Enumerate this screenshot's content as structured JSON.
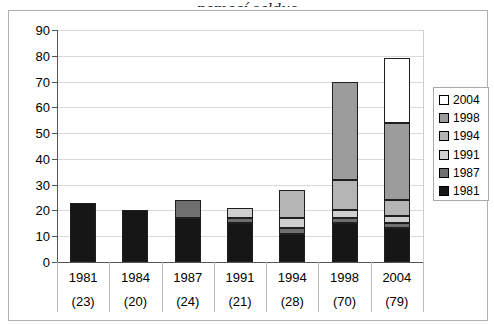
{
  "chart_data": {
    "type": "bar",
    "stacked": true,
    "partial_title_text": "pomocí saldus",
    "categories": [
      "1981",
      "1984",
      "1987",
      "1991",
      "1994",
      "1998",
      "2004"
    ],
    "category_counts": [
      "(23)",
      "(20)",
      "(24)",
      "(21)",
      "(28)",
      "(70)",
      "(79)"
    ],
    "totals": [
      23,
      20,
      24,
      21,
      28,
      70,
      79
    ],
    "series": [
      {
        "name": "1981",
        "color": "#161616",
        "values": [
          23,
          20,
          17,
          15,
          11,
          15,
          13
        ]
      },
      {
        "name": "1987",
        "color": "#6f6f6f",
        "values": [
          0,
          0,
          7,
          2,
          2,
          2,
          2
        ]
      },
      {
        "name": "1991",
        "color": "#cfcfcf",
        "values": [
          0,
          0,
          0,
          4,
          4,
          3,
          3
        ]
      },
      {
        "name": "1994",
        "color": "#b5b5b5",
        "values": [
          0,
          0,
          0,
          0,
          11,
          12,
          6
        ]
      },
      {
        "name": "1998",
        "color": "#9c9c9c",
        "values": [
          0,
          0,
          0,
          0,
          0,
          38,
          30
        ]
      },
      {
        "name": "2004",
        "color": "#ffffff",
        "values": [
          0,
          0,
          0,
          0,
          0,
          0,
          25
        ]
      }
    ],
    "legend_order": [
      "2004",
      "1998",
      "1994",
      "1991",
      "1987",
      "1981"
    ],
    "y_ticks": [
      0,
      10,
      20,
      30,
      40,
      50,
      60,
      70,
      80,
      90
    ],
    "ylim": [
      0,
      90
    ],
    "grid": true,
    "legend_position": "right"
  }
}
